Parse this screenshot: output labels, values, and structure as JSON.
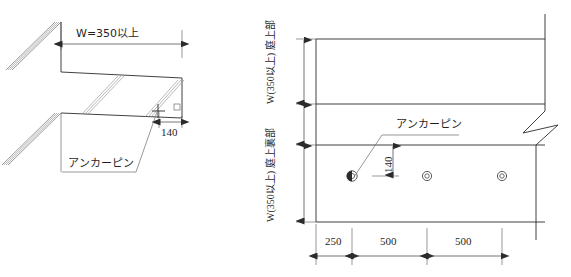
{
  "drawing": {
    "title": "庭アンカーピン取付詳細図",
    "line_color": "#2b2b2b",
    "background": "#ffffff"
  },
  "left_view": {
    "name": "section-view",
    "width_dimension": "W=350以上",
    "edge_dimension": "140",
    "anchor_label": "アンカーピン",
    "right_angle_marker": "□"
  },
  "right_view": {
    "name": "plan-view",
    "upper_zone_label": "庭上部",
    "upper_zone_dimension": "W(350以上)",
    "lower_zone_label": "庭上裏部",
    "lower_zone_dimension": "W(350以上)",
    "anchor_label": "アンカーピン",
    "edge_offset_dimension": "140",
    "spacing_dimensions": [
      "250",
      "500",
      "500"
    ],
    "anchor_pin_count": 3
  }
}
